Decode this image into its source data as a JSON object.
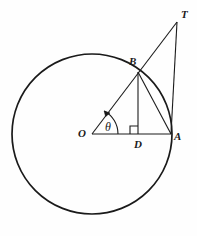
{
  "figure": {
    "background_color": "#fefefe",
    "stroke_color": "#1a1a1a",
    "width": 197,
    "height": 236
  },
  "labels": {
    "center": "O",
    "point_a": "A",
    "point_b": "B",
    "point_t": "T",
    "point_d": "D",
    "angle": "θ"
  },
  "geometry": {
    "circle": {
      "cx": 92,
      "cy": 134,
      "r": 80
    },
    "points": {
      "O": {
        "x": 92,
        "y": 134
      },
      "A": {
        "x": 171,
        "y": 134
      },
      "B": {
        "x": 138,
        "y": 72
      },
      "T": {
        "x": 177,
        "y": 22
      },
      "D": {
        "x": 138,
        "y": 134
      }
    },
    "segments": [
      {
        "name": "radius-OA",
        "from": "O",
        "to": "A"
      },
      {
        "name": "ray-OT",
        "from": "O",
        "to": "T"
      },
      {
        "name": "chord-BA",
        "from": "B",
        "to": "A"
      },
      {
        "name": "tangent-TA",
        "from": "T",
        "to": "A"
      },
      {
        "name": "altitude-BD",
        "from": "B",
        "to": "D"
      }
    ],
    "angle_arc": {
      "vertex": "O",
      "radius": 26,
      "start_deg": 0,
      "end_deg": 62,
      "arrowhead": "end"
    },
    "right_angle": {
      "at": "D",
      "size": 8,
      "orientation": "upper-left"
    }
  }
}
